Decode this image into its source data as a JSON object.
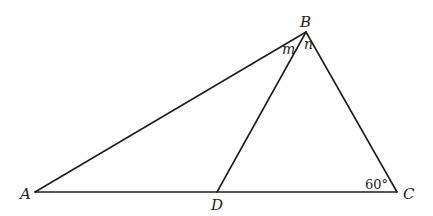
{
  "diagram": {
    "type": "triangle-geometry",
    "vertices": {
      "A": {
        "label": "A",
        "x": 35,
        "y": 192
      },
      "B": {
        "label": "B",
        "x": 306,
        "y": 32
      },
      "C": {
        "label": "C",
        "x": 397,
        "y": 192
      },
      "D": {
        "label": "D",
        "x": 217,
        "y": 192
      }
    },
    "segments": [
      "AB",
      "BC",
      "CA",
      "BD"
    ],
    "angle_labels": {
      "m": "m",
      "n": "n",
      "angle_c": "60°"
    },
    "colors": {
      "stroke": "#1f1f1f",
      "background": "#fefefe"
    }
  }
}
